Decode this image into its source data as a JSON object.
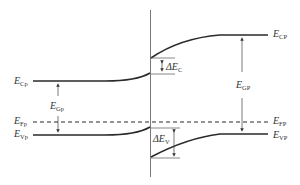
{
  "diagram": {
    "type": "energy band diagram of heterojunction",
    "labels": {
      "ecp_left": {
        "main": "E",
        "sub": "Cp"
      },
      "egp_left": {
        "main": "E",
        "sub": "Gp"
      },
      "efp_left": {
        "main": "E",
        "sub": "Fp"
      },
      "evp_left": {
        "main": "E",
        "sub": "Vp"
      },
      "ecp_right": {
        "main": "E",
        "sub": "CP"
      },
      "egp_right": {
        "main": "E",
        "sub": "GP"
      },
      "efp_right": {
        "main": "E",
        "sub": "FP"
      },
      "evp_right": {
        "main": "E",
        "sub": "VP"
      },
      "delta_ec": {
        "main": "ΔE",
        "sub": "C"
      },
      "delta_ev": {
        "main": "ΔE",
        "sub": "V"
      }
    },
    "colors": {
      "line": "#2a2a2a",
      "text": "#333333",
      "background": "#ffffff"
    }
  }
}
